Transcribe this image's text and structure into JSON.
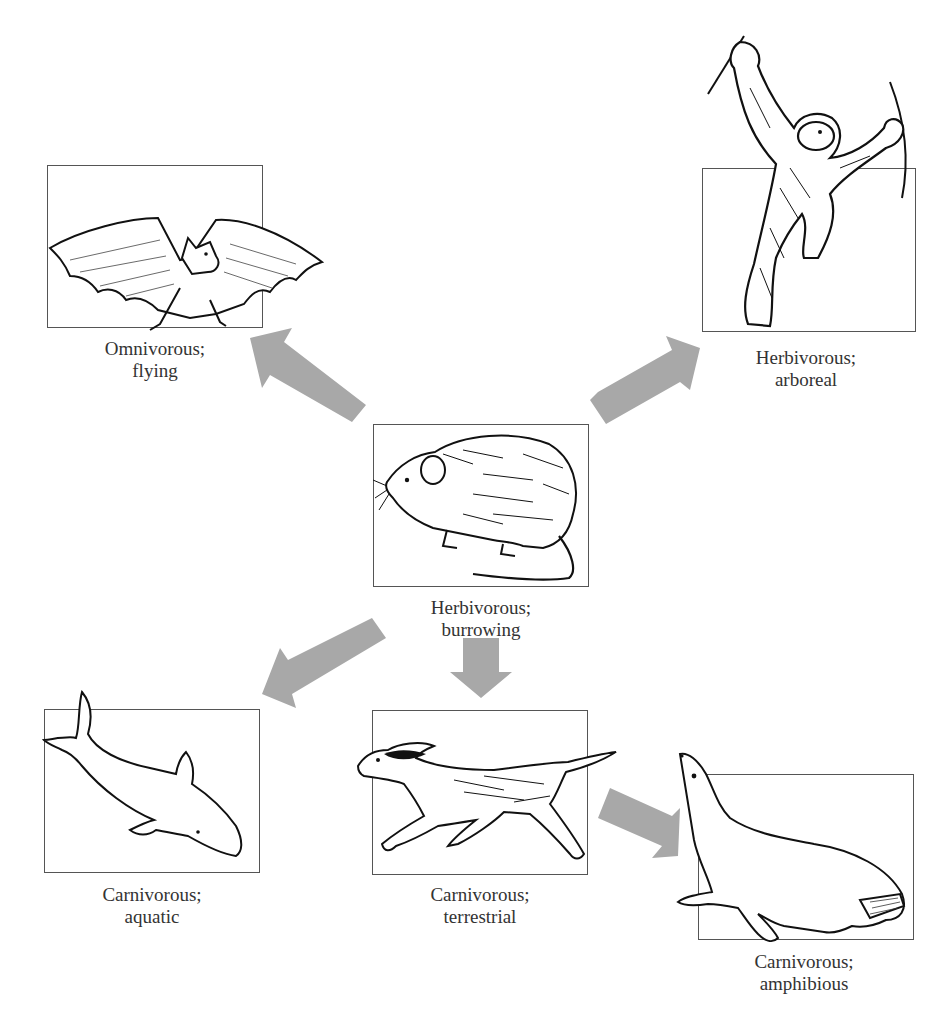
{
  "diagram": {
    "type": "adaptive-radiation",
    "arrow_color": "#a8a8a8",
    "frame_color": "#555555",
    "ancestor": {
      "id": "rodent",
      "line1": "Herbivorous;",
      "line2": "burrowing",
      "animal": "rodent"
    },
    "descendants": [
      {
        "id": "bat",
        "line1": "Omnivorous;",
        "line2": "flying",
        "animal": "bat"
      },
      {
        "id": "chimp",
        "line1": "Herbivorous;",
        "line2": "arboreal",
        "animal": "chimpanzee"
      },
      {
        "id": "dolphin",
        "line1": "Carnivorous;",
        "line2": "aquatic",
        "animal": "dolphin"
      },
      {
        "id": "dog",
        "line1": "Carnivorous;",
        "line2": "terrestrial",
        "animal": "dog"
      },
      {
        "id": "sealion",
        "line1": "Carnivorous;",
        "line2": "amphibious",
        "animal": "sea lion"
      }
    ],
    "arrows": [
      {
        "from": "rodent",
        "to": "bat",
        "direction": "up-left"
      },
      {
        "from": "rodent",
        "to": "chimp",
        "direction": "up-right"
      },
      {
        "from": "rodent",
        "to": "dolphin",
        "direction": "down-left"
      },
      {
        "from": "rodent",
        "to": "dog",
        "direction": "down"
      },
      {
        "from": "dog",
        "to": "sealion",
        "direction": "down-right"
      }
    ]
  }
}
